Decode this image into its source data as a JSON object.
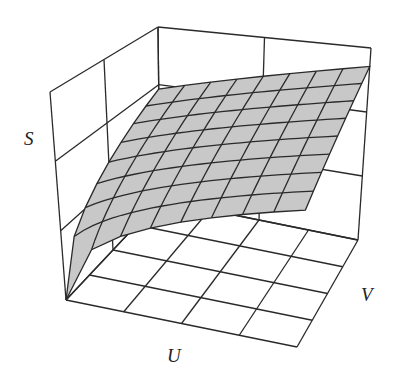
{
  "chart_data": {
    "type": "surface3d",
    "title": "",
    "axes": {
      "x_label": "U",
      "y_label": "V",
      "z_label": "S"
    },
    "grid": {
      "walls": true,
      "floor_divisions": 4,
      "wall_divisions": 3
    },
    "surface": {
      "description": "Concave increasing surface S(U,V), rising steeply near U=0,V=0 and flattening toward larger U and V",
      "mesh_lines_u": 8,
      "mesh_lines_v": 8,
      "fill_color": "#c8c8c8",
      "line_color": "#2a2a2a"
    }
  },
  "labels": {
    "s": "S",
    "u": "U",
    "v": "V"
  },
  "colors": {
    "background": "#ffffff",
    "grid": "#2a2a2a",
    "surface": "#c6c6c6"
  }
}
